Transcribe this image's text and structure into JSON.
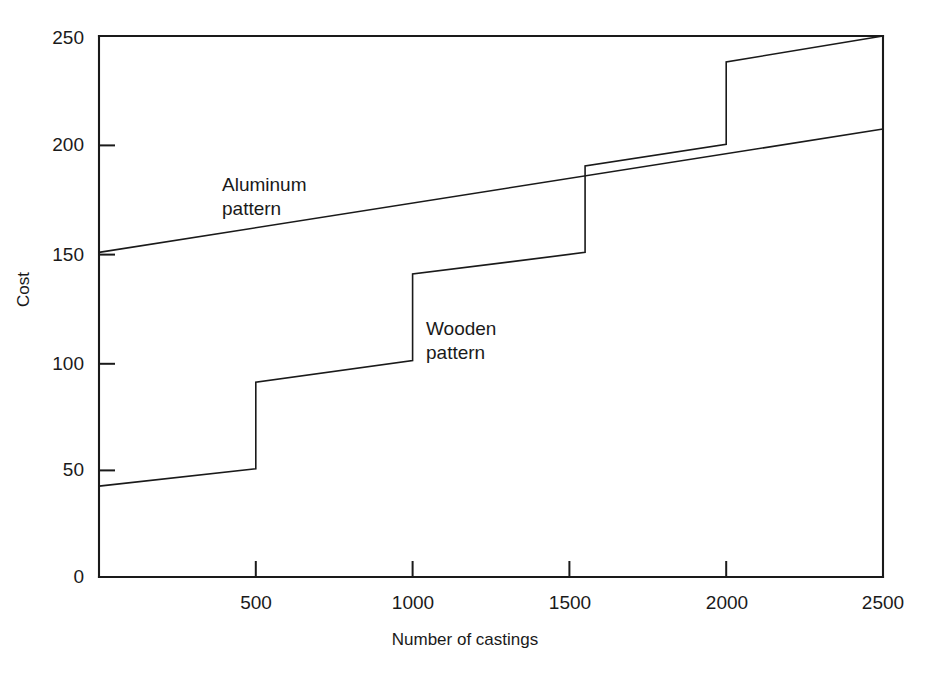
{
  "chart_data": {
    "type": "line",
    "title": "",
    "xlabel": "Number of castings",
    "ylabel": "Cost",
    "xlim": [
      0,
      2500
    ],
    "ylim": [
      0,
      250
    ],
    "xticks": [
      0,
      500,
      1000,
      1500,
      2000,
      2500
    ],
    "xticklabels": [
      "",
      "500",
      "1000",
      "1500",
      "2000",
      "2500"
    ],
    "yticks": [
      0,
      50,
      100,
      150,
      200,
      250
    ],
    "yticklabels": [
      "0",
      "50",
      "100",
      "150",
      "200",
      "250"
    ],
    "grid": false,
    "legend_position": "inline-annotations",
    "line_color": "#1a1a1a",
    "background_color": "#ffffff",
    "series": [
      {
        "name": "Aluminum pattern",
        "style": "linear",
        "annotation": "Aluminum\npattern",
        "points": [
          {
            "x": 0,
            "y": 150
          },
          {
            "x": 2500,
            "y": 207
          }
        ]
      },
      {
        "name": "Wooden pattern",
        "style": "step-with-jumps",
        "annotation": "Wooden\npattern",
        "points": [
          {
            "x": 0,
            "y": 42
          },
          {
            "x": 500,
            "y": 50
          },
          {
            "x": 500,
            "y": 90
          },
          {
            "x": 1000,
            "y": 100
          },
          {
            "x": 1000,
            "y": 140
          },
          {
            "x": 1550,
            "y": 150
          },
          {
            "x": 1550,
            "y": 190
          },
          {
            "x": 2000,
            "y": 200
          },
          {
            "x": 2000,
            "y": 238
          },
          {
            "x": 2500,
            "y": 250
          }
        ]
      }
    ]
  },
  "axes": {
    "y_tick_0": "0",
    "y_tick_50": "50",
    "y_tick_100": "100",
    "y_tick_150": "150",
    "y_tick_200": "200",
    "y_tick_250": "250",
    "x_tick_500": "500",
    "x_tick_1000": "1000",
    "x_tick_1500": "1500",
    "x_tick_2000": "2000",
    "x_tick_2500": "2500",
    "x_title": "Number of castings",
    "y_title": "Cost"
  },
  "annotations": {
    "aluminum": "Aluminum\npattern",
    "wooden": "Wooden\npattern"
  }
}
